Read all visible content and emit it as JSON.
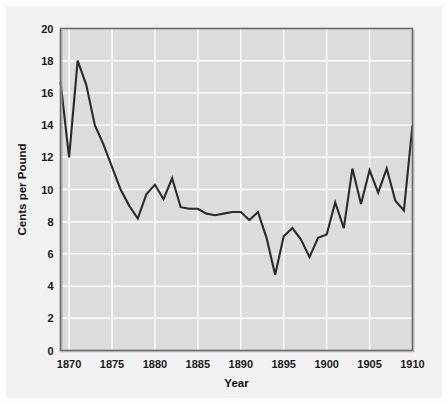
{
  "chart_data": {
    "type": "line",
    "title": "",
    "xlabel": "Year",
    "ylabel": "Cents per Pound",
    "xlim": [
      1869,
      1910
    ],
    "ylim": [
      0,
      20
    ],
    "xticks": [
      1870,
      1875,
      1880,
      1885,
      1890,
      1895,
      1900,
      1905,
      1910
    ],
    "xticklabels": [
      "1870",
      "1875",
      "1880",
      "1885",
      "1890",
      "1895",
      "1900",
      "1905",
      "1910"
    ],
    "yticks": [
      0,
      2,
      4,
      6,
      8,
      10,
      12,
      14,
      16,
      18,
      20
    ],
    "yticklabels": [
      "0",
      "2",
      "4",
      "6",
      "8",
      "10",
      "12",
      "14",
      "16",
      "18",
      "20"
    ],
    "grid": true,
    "grid_color": "#ffffff",
    "plot_bg": "#dcdcdc",
    "figure_bg": "#f2f2f2",
    "line_color": "#2b2b2b",
    "line_width": 2.1,
    "legend": null,
    "x": [
      1869,
      1870,
      1871,
      1872,
      1873,
      1874,
      1875,
      1876,
      1877,
      1878,
      1879,
      1880,
      1881,
      1882,
      1883,
      1884,
      1885,
      1886,
      1887,
      1888,
      1889,
      1890,
      1891,
      1892,
      1893,
      1894,
      1895,
      1896,
      1897,
      1898,
      1899,
      1900,
      1901,
      1902,
      1903,
      1904,
      1905,
      1906,
      1907,
      1908,
      1909,
      1910
    ],
    "values": [
      16.7,
      12.0,
      18.0,
      16.5,
      14.0,
      12.8,
      11.4,
      10.0,
      9.0,
      8.2,
      9.7,
      10.3,
      9.4,
      10.7,
      8.9,
      8.8,
      8.8,
      8.5,
      8.4,
      8.5,
      8.6,
      8.6,
      8.1,
      8.6,
      7.0,
      4.7,
      7.1,
      7.6,
      6.9,
      5.8,
      7.0,
      7.2,
      9.2,
      7.6,
      11.3,
      9.1,
      11.2,
      9.8,
      11.3,
      9.3,
      8.7,
      14.0
    ],
    "series": [
      {
        "name": "Cotton price",
        "values": [
          16.7,
          12.0,
          18.0,
          16.5,
          14.0,
          12.8,
          11.4,
          10.0,
          9.0,
          8.2,
          9.7,
          10.3,
          9.4,
          10.7,
          8.9,
          8.8,
          8.8,
          8.5,
          8.4,
          8.5,
          8.6,
          8.6,
          8.1,
          8.6,
          7.0,
          4.7,
          7.1,
          7.6,
          6.9,
          5.8,
          7.0,
          7.2,
          9.2,
          7.6,
          11.3,
          9.1,
          11.2,
          9.8,
          11.3,
          9.3,
          8.7,
          14.0
        ]
      }
    ]
  }
}
